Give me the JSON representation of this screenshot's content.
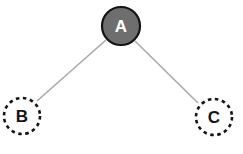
{
  "diagram": {
    "type": "tree",
    "nodes": [
      {
        "id": "A",
        "label": "A",
        "style": "filled",
        "fill": "#6e6e6e",
        "stroke": "#141414",
        "text_color": "#ffffff"
      },
      {
        "id": "B",
        "label": "B",
        "style": "dashed",
        "fill": "#ffffff",
        "stroke": "#141414",
        "text_color": "#141414"
      },
      {
        "id": "C",
        "label": "C",
        "style": "dashed",
        "fill": "#ffffff",
        "stroke": "#141414",
        "text_color": "#141414"
      }
    ],
    "edges": [
      {
        "from": "A",
        "to": "B",
        "color": "#a9a9a9"
      },
      {
        "from": "A",
        "to": "C",
        "color": "#a9a9a9"
      }
    ]
  }
}
